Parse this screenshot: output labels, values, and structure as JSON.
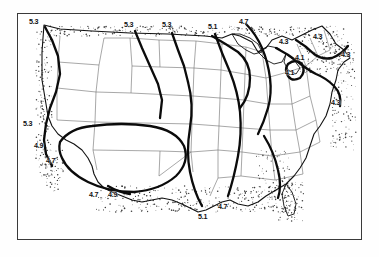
{
  "figure": {
    "frame": {
      "border_color": "#3a3a3a"
    },
    "colors": {
      "contour": "#0b0b0b",
      "state_border": "#6f6f6f",
      "coastline": "#111111",
      "stipple": "#3d3d3d",
      "background": "#ffffff"
    }
  },
  "chart_data": {
    "type": "map",
    "units": "",
    "contour_levels": [
      4.1,
      4.3,
      4.7,
      4.9,
      5.1,
      5.3
    ],
    "labels": [
      {
        "value": "5.3",
        "x": 33,
        "y": 22,
        "region": "pacific-northwest-coast"
      },
      {
        "value": "5.3",
        "x": 128,
        "y": 25,
        "region": "northern-plains-border"
      },
      {
        "value": "5.3",
        "x": 166,
        "y": 25,
        "region": "north-central-border"
      },
      {
        "value": "5.3",
        "x": 27,
        "y": 124,
        "region": "northern-california-coast"
      },
      {
        "value": "5.1",
        "x": 212,
        "y": 27,
        "region": "upper-midwest-border"
      },
      {
        "value": "5.1",
        "x": 202,
        "y": 217,
        "region": "louisiana-gulf-coast"
      },
      {
        "value": "4.9",
        "x": 38,
        "y": 146,
        "region": "central-california-coast"
      },
      {
        "value": "4.9",
        "x": 112,
        "y": 195,
        "region": "south-texas-coast"
      },
      {
        "value": "4.7",
        "x": 243,
        "y": 22,
        "region": "great-lakes-north"
      },
      {
        "value": "4.7",
        "x": 50,
        "y": 161,
        "region": "southern-california-coast"
      },
      {
        "value": "4.7",
        "x": 93,
        "y": 195,
        "region": "texas-gulf-coast"
      },
      {
        "value": "4.7",
        "x": 222,
        "y": 207,
        "region": "northern-gulf-coast"
      },
      {
        "value": "4.3",
        "x": 283,
        "y": 42,
        "region": "eastern-great-lakes"
      },
      {
        "value": "4.3",
        "x": 317,
        "y": 37,
        "region": "northern-new-england"
      },
      {
        "value": "4.3",
        "x": 345,
        "y": 55,
        "region": "maine-coast"
      },
      {
        "value": "4.3",
        "x": 335,
        "y": 103,
        "region": "mid-atlantic-coast"
      },
      {
        "value": "4.1",
        "x": 299,
        "y": 58,
        "region": "new-york-state"
      },
      {
        "value": "4.1",
        "x": 289,
        "y": 73,
        "region": "pennsylvania"
      }
    ]
  }
}
